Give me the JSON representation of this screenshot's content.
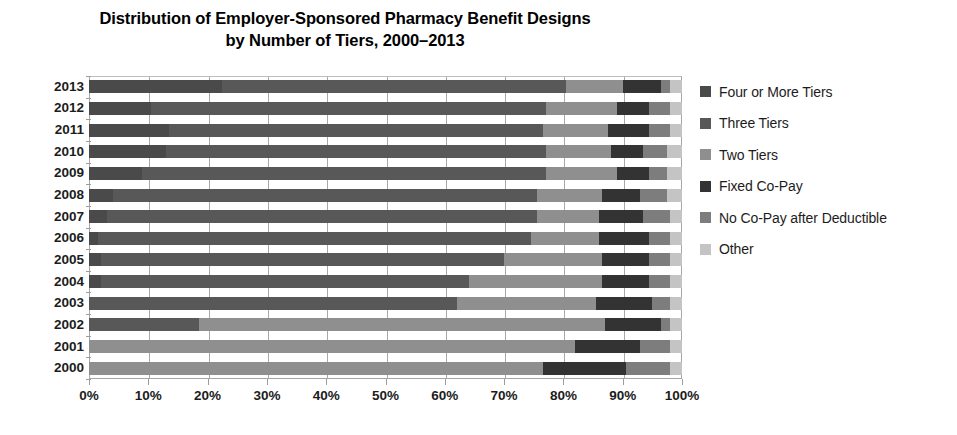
{
  "chart_data": {
    "type": "bar",
    "subtype": "horizontal-100-percent-stacked",
    "title": "Distribution of Employer-Sponsored Pharmacy Benefit Designs by Number of Tiers, 2000–2013",
    "title_lines": [
      "Distribution of Employer-Sponsored Pharmacy Benefit Designs",
      "by Number of Tiers, 2000–2013"
    ],
    "xlabel": "",
    "ylabel": "",
    "xlim": [
      0,
      100
    ],
    "xticks": [
      0,
      10,
      20,
      30,
      40,
      50,
      60,
      70,
      80,
      90,
      100
    ],
    "xtick_labels": [
      "0%",
      "10%",
      "20%",
      "30%",
      "40%",
      "50%",
      "60%",
      "70%",
      "80%",
      "90%",
      "100%"
    ],
    "grid": true,
    "grid_axis": "x",
    "legend_position": "right",
    "categories": [
      "2013",
      "2012",
      "2011",
      "2010",
      "2009",
      "2008",
      "2007",
      "2006",
      "2005",
      "2004",
      "2003",
      "2002",
      "2001",
      "2000"
    ],
    "series": [
      {
        "name": "Four or More Tiers",
        "color": "#4a4a4a",
        "values": [
          22.5,
          10.5,
          13.5,
          13.0,
          9.0,
          4.0,
          3.0,
          1.5,
          2.0,
          2.0,
          0.0,
          0.0,
          0.0,
          0.0
        ]
      },
      {
        "name": "Three Tiers",
        "color": "#585858",
        "values": [
          58.0,
          66.5,
          63.0,
          64.0,
          68.0,
          71.5,
          72.5,
          73.0,
          68.0,
          62.0,
          62.0,
          18.5,
          0.0,
          0.0
        ]
      },
      {
        "name": "Two Tiers",
        "color": "#8f8f8f",
        "values": [
          9.5,
          12.0,
          11.0,
          11.0,
          12.0,
          11.0,
          10.5,
          11.5,
          16.5,
          22.5,
          23.5,
          68.5,
          82.0,
          76.5
        ]
      },
      {
        "name": "Fixed Co-Pay",
        "color": "#333333",
        "values": [
          6.5,
          5.5,
          7.0,
          5.5,
          5.5,
          6.5,
          7.5,
          8.5,
          8.0,
          8.0,
          9.5,
          9.5,
          11.0,
          14.0
        ]
      },
      {
        "name": "No Co-Pay after Deductible",
        "color": "#7d7d7d",
        "values": [
          1.5,
          3.5,
          3.5,
          4.0,
          3.0,
          4.5,
          4.5,
          3.5,
          3.5,
          3.5,
          3.0,
          1.5,
          5.0,
          7.5
        ]
      },
      {
        "name": "Other",
        "color": "#c4c4c4",
        "values": [
          2.0,
          2.0,
          2.0,
          2.5,
          2.5,
          2.5,
          2.0,
          2.0,
          2.0,
          2.0,
          2.0,
          2.0,
          2.0,
          2.0
        ]
      }
    ]
  },
  "legend": {
    "items": [
      {
        "label": "Four or More Tiers",
        "color": "#4a4a4a"
      },
      {
        "label": "Three Tiers",
        "color": "#585858"
      },
      {
        "label": "Two Tiers",
        "color": "#8f8f8f"
      },
      {
        "label": "Fixed Co-Pay",
        "color": "#333333"
      },
      {
        "label": "No Co-Pay after Deductible",
        "color": "#7d7d7d"
      },
      {
        "label": "Other",
        "color": "#c4c4c4"
      }
    ]
  }
}
